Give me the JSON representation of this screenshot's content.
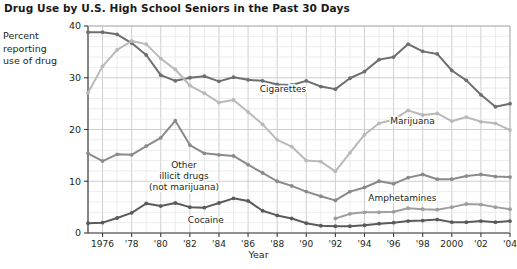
{
  "chart_data": {
    "type": "line",
    "title": "Drug Use by U.S. High School Seniors in the Past 30 Days",
    "ylabel": "Percent reporting use of drug",
    "ylabel_lines": [
      "Percent",
      "reporting",
      "use of drug"
    ],
    "xlabel": "Year",
    "ylim": [
      0,
      40
    ],
    "xlim": [
      1975,
      2004
    ],
    "yticks": [
      0,
      10,
      20,
      30,
      40
    ],
    "ytick_labels": [
      "0",
      "10",
      "20",
      "30",
      "40"
    ],
    "y_minor_step": 2,
    "x_minor_step": 1,
    "grid": true,
    "legend_position": "inline-annotations",
    "xticks": [
      1976,
      1978,
      1980,
      1982,
      1984,
      1986,
      1988,
      1990,
      1992,
      1994,
      1996,
      1998,
      2000,
      2002,
      2004
    ],
    "xtick_labels": [
      "1976",
      "'78",
      "'80",
      "'82",
      "'84",
      "'86",
      "'88",
      "'90",
      "'92",
      "'94",
      "'96",
      "'98",
      "2000",
      "'02",
      "'04"
    ],
    "x": [
      1975,
      1976,
      1977,
      1978,
      1979,
      1980,
      1981,
      1982,
      1983,
      1984,
      1985,
      1986,
      1987,
      1988,
      1989,
      1990,
      1991,
      1992,
      1993,
      1994,
      1995,
      1996,
      1997,
      1998,
      1999,
      2000,
      2001,
      2002,
      2003,
      2004
    ],
    "series": [
      {
        "name": "Cigarettes",
        "color": "#6e6e6e",
        "label_x": 1988.4,
        "label_y": 27.2,
        "values": [
          38.8,
          38.8,
          38.4,
          36.7,
          34.4,
          30.5,
          29.4,
          30.0,
          30.3,
          29.3,
          30.1,
          29.6,
          29.4,
          28.7,
          28.6,
          29.4,
          28.3,
          27.8,
          29.9,
          31.2,
          33.5,
          34.0,
          36.5,
          35.1,
          34.6,
          31.4,
          29.5,
          26.7,
          24.4,
          25.0
        ]
      },
      {
        "name": "Marijuana",
        "color": "#b9b9b9",
        "label_x": 1997.3,
        "label_y": 21.0,
        "values": [
          27.1,
          32.2,
          35.4,
          37.1,
          36.5,
          33.7,
          31.6,
          28.5,
          27.0,
          25.2,
          25.7,
          23.4,
          21.0,
          18.0,
          16.7,
          14.0,
          13.8,
          11.9,
          15.5,
          19.0,
          21.2,
          21.9,
          23.7,
          22.8,
          23.1,
          21.6,
          22.4,
          21.5,
          21.2,
          19.9
        ]
      },
      {
        "name": "Other illicit drugs (not marijuana)",
        "color": "#8a8a8a",
        "label_x": 1981.6,
        "label_y": 12.6,
        "label_lines": [
          "Other",
          "illicit drugs",
          "(not marijuana)"
        ],
        "values": [
          15.4,
          13.9,
          15.2,
          15.1,
          16.8,
          18.4,
          21.7,
          17.0,
          15.4,
          15.1,
          14.9,
          13.2,
          11.6,
          10.0,
          9.1,
          8.0,
          7.1,
          6.3,
          8.0,
          8.8,
          10.0,
          9.5,
          10.7,
          11.3,
          10.4,
          10.4,
          11.0,
          11.3,
          10.9,
          10.8
        ]
      },
      {
        "name": "Cocaine",
        "color": "#5a5a5a",
        "label_x": 1983.1,
        "label_y": 2.0,
        "values": [
          1.9,
          2.0,
          2.9,
          3.9,
          5.7,
          5.2,
          5.8,
          5.0,
          4.9,
          5.8,
          6.7,
          6.2,
          4.3,
          3.4,
          2.8,
          1.9,
          1.4,
          1.3,
          1.3,
          1.5,
          1.8,
          2.0,
          2.3,
          2.4,
          2.6,
          2.1,
          2.1,
          2.3,
          2.1,
          2.3
        ]
      },
      {
        "name": "Amphetamines",
        "color": "#9e9e9e",
        "label_x": 1996.6,
        "label_y": 6.2,
        "start_year": 1992,
        "values": [
          null,
          null,
          null,
          null,
          null,
          null,
          null,
          null,
          null,
          null,
          null,
          null,
          null,
          null,
          null,
          null,
          null,
          2.8,
          3.7,
          4.0,
          4.0,
          4.1,
          4.8,
          4.6,
          4.5,
          5.0,
          5.6,
          5.5,
          5.0,
          4.6
        ]
      }
    ]
  }
}
